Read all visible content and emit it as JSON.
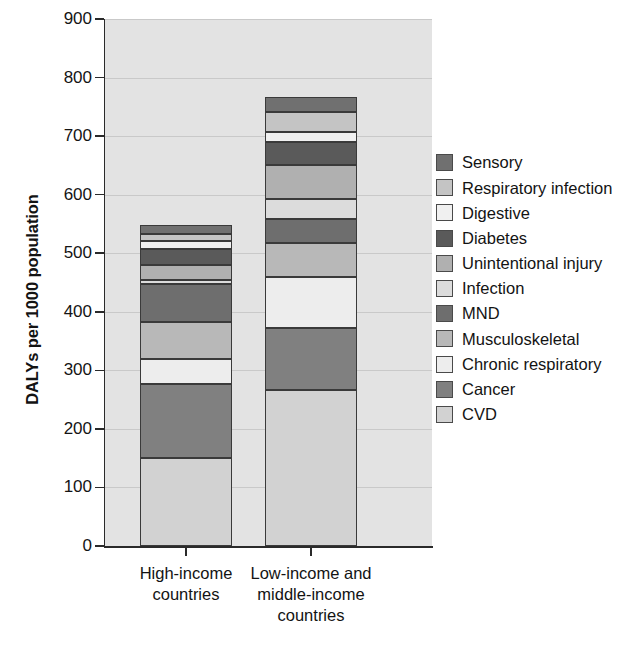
{
  "chart_data": {
    "type": "bar",
    "subtype": "stacked-bar",
    "title": "",
    "xlabel": "",
    "ylabel": "DALYs per 1000 population",
    "ylim": [
      0,
      900
    ],
    "yticks": [
      0,
      100,
      200,
      300,
      400,
      500,
      600,
      700,
      800,
      900
    ],
    "ytick_labels": [
      "0",
      "100",
      "200",
      "300",
      "400",
      "500",
      "600",
      "700",
      "800",
      "900"
    ],
    "grid": true,
    "grid_axis": "y",
    "legend_position": "right",
    "categories": [
      "High-income countries",
      "Low-income and middle-income countries"
    ],
    "category_lines": [
      [
        "High-income",
        "countries"
      ],
      [
        "Low-income and",
        "middle-income",
        "countries"
      ]
    ],
    "totals": [
      548,
      766
    ],
    "series": [
      {
        "name": "CVD",
        "color": "#d2d2d2",
        "values": [
          150,
          266
        ]
      },
      {
        "name": "Cancer",
        "color": "#808080",
        "values": [
          127,
          107
        ]
      },
      {
        "name": "Chronic respiratory",
        "color": "#ededed",
        "values": [
          43,
          87
        ]
      },
      {
        "name": "Musculoskeletal",
        "color": "#b8b8b8",
        "values": [
          63,
          57
        ]
      },
      {
        "name": "MND",
        "color": "#6e6e6e",
        "values": [
          65,
          41
        ]
      },
      {
        "name": "Infection",
        "color": "#dcdcdc",
        "values": [
          7,
          34
        ]
      },
      {
        "name": "Unintentional injury",
        "color": "#b0b0b0",
        "values": [
          25,
          59
        ]
      },
      {
        "name": "Diabetes",
        "color": "#5a5a5a",
        "values": [
          28,
          39
        ]
      },
      {
        "name": "Digestive",
        "color": "#f0f0f0",
        "values": [
          13,
          17
        ]
      },
      {
        "name": "Respiratory infection",
        "color": "#c4c4c4",
        "values": [
          12,
          35
        ]
      },
      {
        "name": "Sensory",
        "color": "#707070",
        "values": [
          15,
          24
        ]
      }
    ],
    "legend_entries_top_to_bottom": [
      "Sensory",
      "Respiratory infection",
      "Digestive",
      "Diabetes",
      "Unintentional injury",
      "Infection",
      "MND",
      "Musculoskeletal",
      "Chronic respiratory",
      "Cancer",
      "CVD"
    ]
  },
  "axes": {
    "ylabel": "DALYs per 1000 population"
  }
}
